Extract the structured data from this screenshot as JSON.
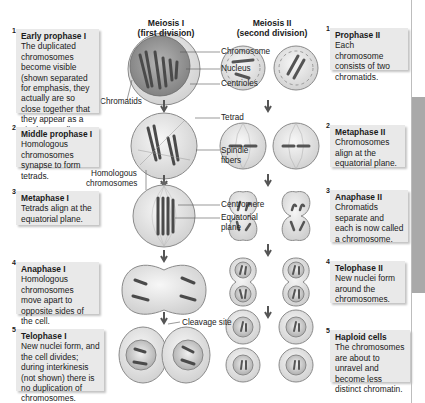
{
  "headings": {
    "meiosis1": "Meiosis I",
    "meiosis1_sub": "(first division)",
    "meiosis2": "Meiosis II",
    "meiosis2_sub": "(second division)"
  },
  "meiosis1_steps": [
    {
      "num": "1",
      "title": "Early prophase I",
      "text": "The duplicated chromosomes become visible (shown separated for emphasis, they actually are so close  together that they appear as a single strand)."
    },
    {
      "num": "2",
      "title": "Middle prophase I",
      "text": "Homologous chromosomes synapse to form tetrads."
    },
    {
      "num": "3",
      "title": "Metaphase I",
      "text": "Tetrads align at the equatorial plane."
    },
    {
      "num": "4",
      "title": "Anaphase I",
      "text": "Homologous chromosomes move apart to opposite sides of the cell."
    },
    {
      "num": "5",
      "title": "Telophase I",
      "text": "New nuclei form, and the cell divides; during interkinesis (not shown) there is no duplication of chromosomes."
    }
  ],
  "meiosis2_steps": [
    {
      "num": "1",
      "title": "Prophase II",
      "text": "Each chromosome consists of two chromatids."
    },
    {
      "num": "2",
      "title": "Metaphase II",
      "text": "Chromosomes align at the equatorial plane."
    },
    {
      "num": "3",
      "title": "Anaphase II",
      "text": "Chromatids separate and each is now called a chromosome."
    },
    {
      "num": "4",
      "title": "Telophase II",
      "text": "New nuclei form around the chromosomes."
    },
    {
      "num": "5",
      "title": "Haploid cells",
      "text": "The chromosomes are about to unravel and become less distinct chromatin."
    }
  ],
  "labels": {
    "chromosome": "Chromosome",
    "nucleus": "Nucleus",
    "centrioles": "Centrioles",
    "chromatids": "Chromatids",
    "tetrad": "Tetrad",
    "spindle": "Spindle",
    "fibers": "fibers",
    "homologous": "Homologous",
    "chromosomes": "chromosomes",
    "centromere": "Centromere",
    "equatorial": "Equatorial",
    "plane": "plane",
    "cleavage": "Cleavage site"
  },
  "colors": {
    "box_bg": "#e9e9e9",
    "cell_fill": "#e4e4e4",
    "nucleus_fill": "#9a9a9a",
    "chromosome": "#555555",
    "side_tab": "#a9a9a9"
  }
}
